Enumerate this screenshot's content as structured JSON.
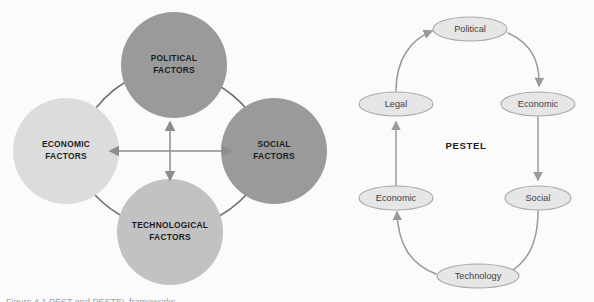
{
  "figure": {
    "caption": "Figure 4.1  PEST and PESTEL frameworks"
  },
  "colors": {
    "background": "#fbfbfb",
    "circle_dark": "#9a9a9a",
    "circle_mid": "#b4b4b4",
    "circle_light": "#dcdcdc",
    "arc_stroke": "#6f6f6f",
    "cross_arrow": "#8c8c8c",
    "pill_fill": "#e6e6e6",
    "pill_stroke": "#a8a8a8",
    "pill_text": "#3f3f3f",
    "loop_arrow": "#9a9a9a",
    "circle_text": "#1c1c1c"
  },
  "pest_diagram": {
    "name": "PEST",
    "circles": [
      {
        "id": "political",
        "line1": "POLITICAL",
        "line2": "FACTORS",
        "cx": 174,
        "cy": 65,
        "r": 53,
        "fill": "#9a9a9a"
      },
      {
        "id": "economic",
        "line1": "ECONOMIC",
        "line2": "FACTORS",
        "cx": 66,
        "cy": 151,
        "r": 53,
        "fill": "#dcdcdc"
      },
      {
        "id": "social",
        "line1": "SOCIAL",
        "line2": "FACTORS",
        "cx": 274,
        "cy": 151,
        "r": 53,
        "fill": "#9a9a9a"
      },
      {
        "id": "technological",
        "line1": "TECHNOLOGICAL",
        "line2": "FACTORS",
        "cx": 170,
        "cy": 232,
        "r": 53,
        "fill": "#c2c2c2"
      }
    ],
    "center_arrows": {
      "cx": 170,
      "cy": 151,
      "up_label": "arrow-up",
      "down_label": "arrow-down",
      "left_label": "arrow-left",
      "right_label": "arrow-right"
    }
  },
  "pestel_diagram": {
    "name": "PESTEL",
    "center_label": "PESTEL",
    "nodes": [
      {
        "id": "political",
        "label": "Political",
        "cx": 170,
        "cy": 29,
        "rx": 37,
        "ry": 12
      },
      {
        "id": "economic-r",
        "label": "Economic",
        "cx": 238,
        "cy": 104,
        "rx": 37,
        "ry": 12
      },
      {
        "id": "social",
        "label": "Social",
        "cx": 238,
        "cy": 198,
        "rx": 33,
        "ry": 12
      },
      {
        "id": "technology",
        "label": "Technology",
        "cx": 178,
        "cy": 276,
        "rx": 41,
        "ry": 12
      },
      {
        "id": "economic-l",
        "label": "Economic",
        "cx": 96,
        "cy": 198,
        "rx": 37,
        "ry": 12
      },
      {
        "id": "legal",
        "label": "Legal",
        "cx": 96,
        "cy": 104,
        "rx": 37,
        "ry": 12
      }
    ],
    "flow_order": [
      "Political",
      "Economic",
      "Social",
      "Technology",
      "Economic",
      "Legal"
    ]
  }
}
